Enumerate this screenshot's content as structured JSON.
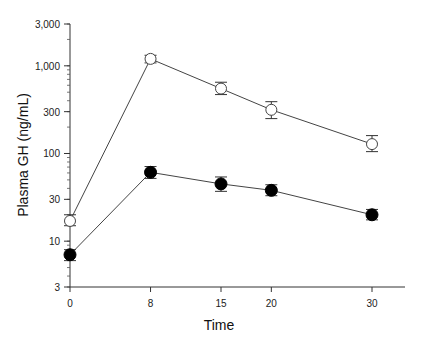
{
  "chart_data": {
    "type": "line",
    "title": "",
    "xlabel": "Time",
    "ylabel": "Plasma GH (ng/mL)",
    "yscale": "log",
    "ylim": [
      3,
      3000
    ],
    "xlim": [
      0,
      35
    ],
    "grid": false,
    "legend": null,
    "x_ticks": [
      0,
      8,
      15,
      20,
      30
    ],
    "x_tick_labels": [
      "0",
      "8",
      "15",
      "20",
      "30"
    ],
    "y_ticks": [
      3,
      10,
      30,
      100,
      300,
      1000,
      3000
    ],
    "y_tick_labels": [
      "3",
      "10",
      "30",
      "100",
      "300",
      "1,000",
      "3,000"
    ],
    "x": [
      0,
      8,
      15,
      20,
      30
    ],
    "series": [
      {
        "name": "open-circles",
        "marker": "open-circle",
        "values": [
          17,
          1200,
          550,
          315,
          128
        ],
        "err_low": [
          15,
          1080,
          470,
          250,
          105
        ],
        "err_high": [
          20,
          1320,
          650,
          390,
          160
        ]
      },
      {
        "name": "filled-circles",
        "marker": "filled-circle",
        "values": [
          7,
          61,
          45,
          38,
          20
        ],
        "err_low": [
          6,
          52,
          37,
          33,
          17.5
        ],
        "err_high": [
          8,
          71,
          54,
          44,
          23
        ]
      }
    ]
  }
}
